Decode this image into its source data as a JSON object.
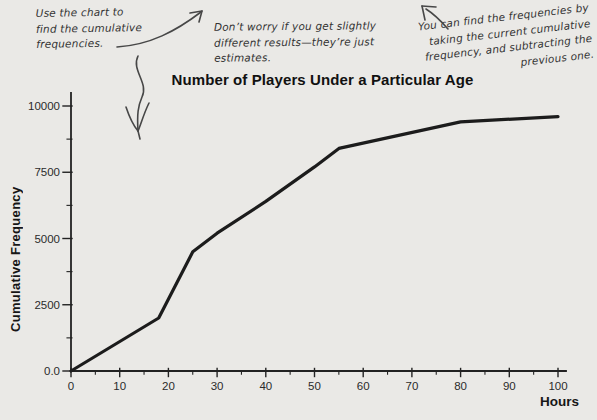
{
  "page": {
    "background": "#eae9e6"
  },
  "annotations": {
    "note1": {
      "lines": [
        "Use the chart to",
        "find the cumulative",
        "frequencies."
      ]
    },
    "note2": {
      "lines": [
        "Don’t worry if you get slightly",
        "different results—they’re just",
        "estimates."
      ]
    },
    "note3": {
      "lines": [
        "You can find the frequencies by",
        "taking the current cumulative",
        "frequency, and subtracting the",
        "previous one."
      ]
    }
  },
  "chart_data": {
    "type": "line",
    "title": "Number of Players Under a Particular Age",
    "xlabel": "Hours",
    "ylabel": "Cumulative Frequency",
    "xlim": [
      0,
      100
    ],
    "ylim": [
      0,
      10000
    ],
    "grid": false,
    "legend": "none",
    "x_ticks": [
      0,
      10,
      20,
      30,
      40,
      50,
      60,
      70,
      80,
      90,
      100
    ],
    "x_minor_tick_step": 5,
    "y_ticks": [
      {
        "value": 0,
        "label": "0.0"
      },
      {
        "value": 2500,
        "label": "2500"
      },
      {
        "value": 5000,
        "label": "5000"
      },
      {
        "value": 7500,
        "label": "7500"
      },
      {
        "value": 10000,
        "label": "10000"
      }
    ],
    "y_minor_ticks": [
      1250,
      3750,
      6250,
      8750
    ],
    "series": [
      {
        "name": "Cumulative Frequency",
        "x": [
          0,
          18,
          25,
          30,
          40,
          50,
          55,
          80,
          100
        ],
        "y": [
          0,
          2000,
          4500,
          5200,
          6400,
          7700,
          8400,
          9400,
          9600
        ]
      }
    ],
    "line_color": "#1c1c1c",
    "axis_color": "#222222",
    "tick_label_color": "#2b2b2b"
  }
}
